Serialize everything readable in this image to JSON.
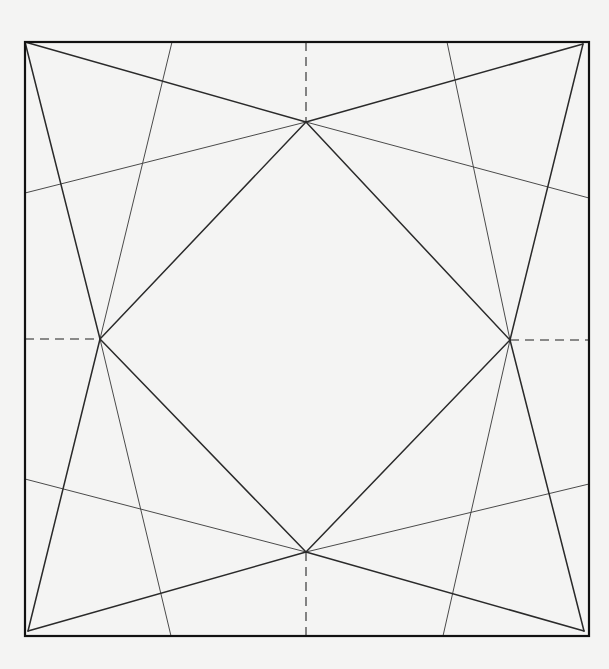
{
  "diagram": {
    "type": "origami-crease-pattern",
    "background": "#f4f4f3",
    "line_color": "#111111",
    "paper_square": {
      "x1": 25,
      "y1": 42,
      "x2": 589,
      "y2": 636
    },
    "reference_points": {
      "top": [
        306,
        122
      ],
      "left": [
        100,
        339
      ],
      "right": [
        510,
        340
      ],
      "bottom": [
        306,
        552
      ]
    },
    "creases": {
      "inner_square": [
        [
          306,
          122,
          510,
          340
        ],
        [
          510,
          340,
          306,
          552
        ],
        [
          306,
          552,
          100,
          339
        ],
        [
          100,
          339,
          306,
          122
        ]
      ],
      "corner_to_point": [
        [
          25,
          42,
          306,
          122
        ],
        [
          583,
          44,
          306,
          122
        ],
        [
          25,
          42,
          100,
          339
        ],
        [
          28,
          631,
          100,
          339
        ],
        [
          583,
          44,
          510,
          340
        ],
        [
          584,
          631,
          510,
          340
        ],
        [
          28,
          631,
          306,
          552
        ],
        [
          584,
          631,
          306,
          552
        ]
      ],
      "thin_lines": [
        [
          25,
          193,
          306,
          122
        ],
        [
          306,
          122,
          589,
          198
        ],
        [
          25,
          479,
          306,
          552
        ],
        [
          306,
          552,
          589,
          484
        ],
        [
          172,
          42,
          100,
          339
        ],
        [
          100,
          339,
          171,
          636
        ],
        [
          447,
          42,
          510,
          340
        ],
        [
          510,
          340,
          443,
          636
        ]
      ],
      "dashed": [
        [
          306,
          42,
          306,
          122
        ],
        [
          306,
          552,
          306,
          636
        ],
        [
          25,
          339,
          100,
          339
        ],
        [
          510,
          340,
          589,
          340
        ]
      ]
    }
  }
}
